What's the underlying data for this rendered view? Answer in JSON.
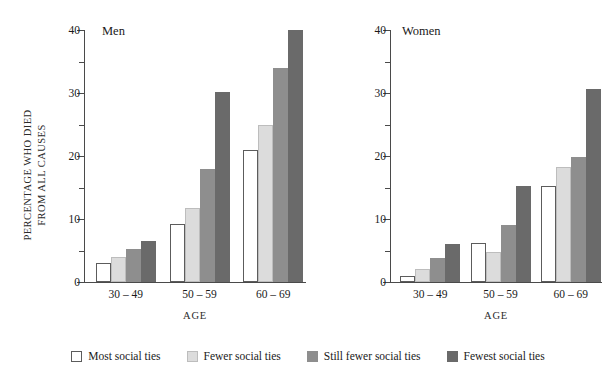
{
  "figure": {
    "ylabel_line1": "PERCENTAGE WHO DIED",
    "ylabel_line2": "FROM ALL CAUSES",
    "xlabel": "AGE"
  },
  "legend": {
    "items": [
      {
        "label": "Most social ties",
        "color": "#ffffff"
      },
      {
        "label": "Fewer social ties",
        "color": "#dcdcdc"
      },
      {
        "label": "Still fewer social ties",
        "color": "#8e8e8e"
      },
      {
        "label": "Fewest social ties",
        "color": "#6a6a6a"
      }
    ]
  },
  "yaxis": {
    "major_ticks": [
      "0",
      "10",
      "20",
      "30",
      "40"
    ],
    "minor_ticks": [
      5,
      15,
      25,
      35
    ],
    "min": 0,
    "max": 40
  },
  "panels": [
    {
      "title": "Men",
      "xlabel": "AGE"
    },
    {
      "title": "Women",
      "xlabel": "AGE"
    }
  ],
  "chart_data": {
    "type": "bar",
    "title": "",
    "subplots": [
      {
        "title": "Men",
        "categories": [
          "30 – 49",
          "50 – 59",
          "60 – 69"
        ],
        "series": [
          {
            "name": "Most social ties",
            "color": "#ffffff",
            "values": [
              3.0,
              9.2,
              21.0
            ]
          },
          {
            "name": "Fewer social ties",
            "color": "#dcdcdc",
            "values": [
              4.0,
              11.8,
              25.0
            ]
          },
          {
            "name": "Still fewer social ties",
            "color": "#8e8e8e",
            "values": [
              5.3,
              18.0,
              34.0
            ]
          },
          {
            "name": "Fewest social ties",
            "color": "#6a6a6a",
            "values": [
              6.5,
              30.2,
              40.0
            ]
          }
        ]
      },
      {
        "title": "Women",
        "categories": [
          "30 – 49",
          "50 – 59",
          "60 – 69"
        ],
        "series": [
          {
            "name": "Most social ties",
            "color": "#ffffff",
            "values": [
              1.0,
              6.2,
              15.3
            ]
          },
          {
            "name": "Fewer social ties",
            "color": "#dcdcdc",
            "values": [
              2.0,
              4.7,
              18.2
            ]
          },
          {
            "name": "Still fewer social ties",
            "color": "#8e8e8e",
            "values": [
              3.8,
              9.0,
              19.8
            ]
          },
          {
            "name": "Fewest social ties",
            "color": "#6a6a6a",
            "values": [
              6.0,
              15.3,
              30.6
            ]
          }
        ]
      }
    ],
    "xlabel": "AGE",
    "ylabel": "PERCENTAGE WHO DIED FROM ALL CAUSES",
    "ylim": [
      0,
      40
    ],
    "yticks": [
      0,
      10,
      20,
      30,
      40
    ],
    "grid": false,
    "legend_position": "bottom"
  }
}
